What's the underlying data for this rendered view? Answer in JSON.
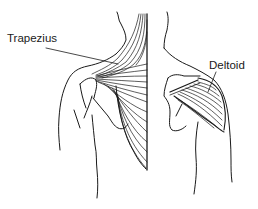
{
  "figure": {
    "labels": {
      "trapezius": "Trapezius",
      "deltoid": "Deltoid"
    },
    "colors": {
      "line": "#1a1a1a",
      "background": "#ffffff"
    }
  }
}
